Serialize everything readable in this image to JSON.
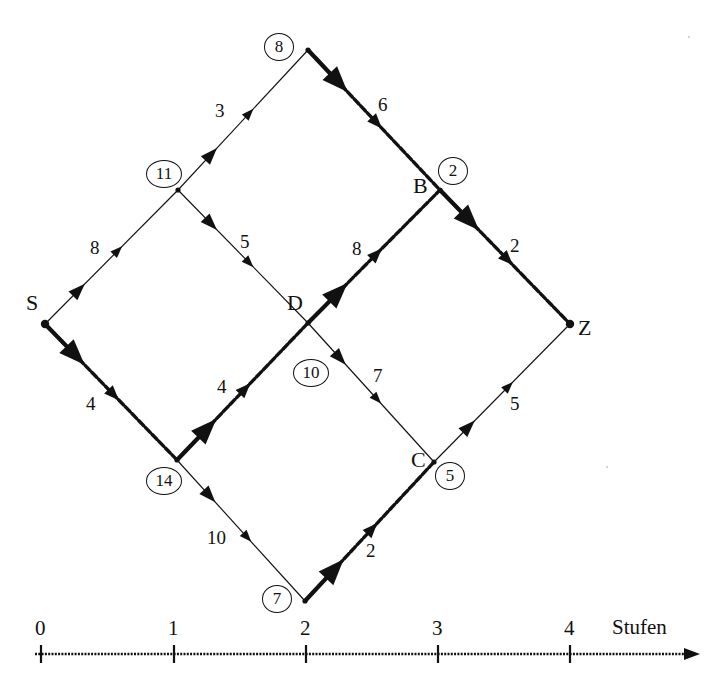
{
  "diagram": {
    "kind": "network-graph",
    "title_text": "",
    "colors": {
      "ink": "#1a1a1a",
      "paper": "#ffffff",
      "critical_path": "#000000"
    }
  },
  "nodes": [
    {
      "id": "S",
      "letter": "S",
      "badge": "",
      "x": 45,
      "y": 324,
      "letter_x": 26,
      "letter_y": 292,
      "badge_x": 0,
      "badge_y": 0
    },
    {
      "id": "N11",
      "letter": "",
      "badge": "11",
      "x": 178,
      "y": 190,
      "letter_x": 0,
      "letter_y": 0,
      "badge_x": 146,
      "badge_y": 160
    },
    {
      "id": "N8",
      "letter": "",
      "badge": "8",
      "x": 308,
      "y": 50,
      "letter_x": 0,
      "letter_y": 0,
      "badge_x": 264,
      "badge_y": 33
    },
    {
      "id": "N14",
      "letter": "",
      "badge": "14",
      "x": 177,
      "y": 460,
      "letter_x": 0,
      "letter_y": 0,
      "badge_x": 146,
      "badge_y": 467
    },
    {
      "id": "D",
      "letter": "D",
      "badge": "10",
      "x": 308,
      "y": 323,
      "letter_x": 287,
      "letter_y": 292,
      "badge_x": 293,
      "badge_y": 359
    },
    {
      "id": "B",
      "letter": "B",
      "badge": "2",
      "x": 440,
      "y": 190,
      "letter_x": 413,
      "letter_y": 175,
      "badge_x": 438,
      "badge_y": 157
    },
    {
      "id": "N7",
      "letter": "",
      "badge": "7",
      "x": 305,
      "y": 601,
      "letter_x": 0,
      "letter_y": 0,
      "badge_x": 262,
      "badge_y": 585
    },
    {
      "id": "C",
      "letter": "C",
      "badge": "5",
      "x": 434,
      "y": 462,
      "letter_x": 411,
      "letter_y": 449,
      "badge_x": 435,
      "badge_y": 462
    },
    {
      "id": "Z",
      "letter": "Z",
      "badge": "",
      "x": 570,
      "y": 324,
      "letter_x": 578,
      "letter_y": 317,
      "badge_x": 0,
      "badge_y": 0
    }
  ],
  "edges": [
    {
      "id": "S-11",
      "from": "S",
      "to": "N11",
      "weight": "8",
      "style": "thin",
      "label_x": 90,
      "label_y": 238
    },
    {
      "id": "S-14",
      "from": "S",
      "to": "N14",
      "weight": "4",
      "style": "bold",
      "label_x": 86,
      "label_y": 394
    },
    {
      "id": "11-8",
      "from": "N11",
      "to": "N8",
      "weight": "3",
      "style": "thin",
      "label_x": 215,
      "label_y": 101
    },
    {
      "id": "11-D",
      "from": "N11",
      "to": "D",
      "weight": "5",
      "style": "thin",
      "label_x": 240,
      "label_y": 232
    },
    {
      "id": "14-D",
      "from": "N14",
      "to": "D",
      "weight": "4",
      "style": "bold",
      "label_x": 217,
      "label_y": 377
    },
    {
      "id": "14-7",
      "from": "N14",
      "to": "N7",
      "weight": "10",
      "style": "thin",
      "label_x": 207,
      "label_y": 528
    },
    {
      "id": "8-B",
      "from": "N8",
      "to": "B",
      "weight": "6",
      "style": "bold",
      "label_x": 378,
      "label_y": 95
    },
    {
      "id": "D-B",
      "from": "D",
      "to": "B",
      "weight": "8",
      "style": "bold",
      "label_x": 352,
      "label_y": 239
    },
    {
      "id": "D-C",
      "from": "D",
      "to": "C",
      "weight": "7",
      "style": "thin",
      "label_x": 373,
      "label_y": 366
    },
    {
      "id": "7-C",
      "from": "N7",
      "to": "C",
      "weight": "2",
      "style": "bold",
      "label_x": 366,
      "label_y": 541
    },
    {
      "id": "B-Z",
      "from": "B",
      "to": "Z",
      "weight": "2",
      "style": "bold",
      "label_x": 510,
      "label_y": 236
    },
    {
      "id": "C-Z",
      "from": "C",
      "to": "Z",
      "weight": "5",
      "style": "thin",
      "label_x": 510,
      "label_y": 394
    }
  ],
  "axis": {
    "name": "Stufen",
    "name_x": 612,
    "name_y": 617,
    "y": 654,
    "x_start": 35,
    "x_end": 700,
    "ticks": [
      {
        "label": "0",
        "x": 41
      },
      {
        "label": "1",
        "x": 174
      },
      {
        "label": "2",
        "x": 306
      },
      {
        "label": "3",
        "x": 438
      },
      {
        "label": "4",
        "x": 570
      }
    ]
  }
}
